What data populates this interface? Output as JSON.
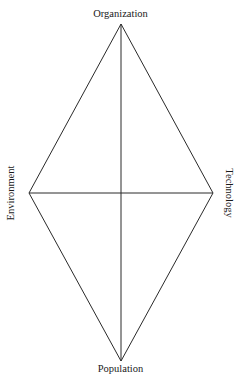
{
  "diagram": {
    "type": "diamond-axes",
    "nodes": {
      "top": {
        "label": "Organization",
        "x": 121,
        "y": 24
      },
      "bottom": {
        "label": "Population",
        "x": 121,
        "y": 361
      },
      "left": {
        "label": "Environment",
        "x": 29,
        "y": 193
      },
      "right": {
        "label": "Technology",
        "x": 213,
        "y": 193
      }
    },
    "edges": [
      [
        "top",
        "right"
      ],
      [
        "right",
        "bottom"
      ],
      [
        "bottom",
        "left"
      ],
      [
        "left",
        "top"
      ],
      [
        "top",
        "bottom"
      ],
      [
        "left",
        "right"
      ]
    ],
    "line_color": "#2a2a2a"
  }
}
